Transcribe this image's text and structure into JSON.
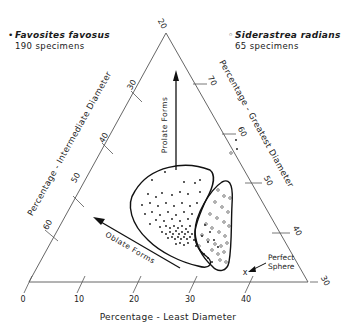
{
  "legend": {
    "left": {
      "marker": "•",
      "species": "Favosites favosus",
      "count": "190 specimens"
    },
    "right": {
      "marker": "◦",
      "species": "Siderastrea radians",
      "count": "65 specimens"
    }
  },
  "axes": {
    "bottom": {
      "label": "Percentage - Least Diameter",
      "ticks": [
        "0",
        "10",
        "20",
        "30",
        "40"
      ]
    },
    "left": {
      "label": "Percentage - Intermediate Diameter",
      "ticks": [
        "30",
        "40",
        "50",
        "60"
      ]
    },
    "right": {
      "label": "Percentage - Greatest Diameter",
      "ticks": [
        "70",
        "60",
        "50",
        "40"
      ]
    },
    "corners": {
      "top": "20",
      "bottom_right": "30"
    }
  },
  "annotations": {
    "prolate": "Prolate Forms",
    "oblate": "Oblate Forms",
    "sphere": "Perfect Sphere",
    "sphere_marker": "x"
  },
  "colors": {
    "ink": "#1a1a1a",
    "axis": "#555555",
    "background": "#ffffff"
  }
}
